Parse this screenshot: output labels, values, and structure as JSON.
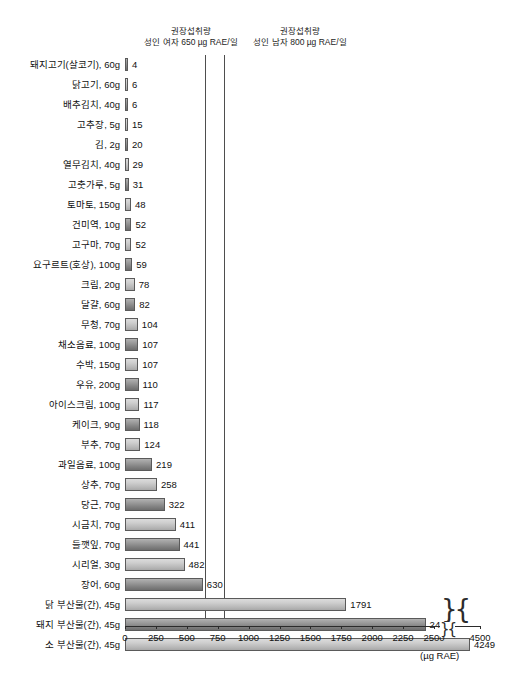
{
  "annotations": {
    "rda_female": {
      "title": "권장섭취량",
      "subtitle": "성인 여자 650 µg RAE/일",
      "value": 650
    },
    "rda_male": {
      "title": "권장섭취량",
      "subtitle": "성인 남자 800 µg RAE/일",
      "value": 800
    }
  },
  "axis": {
    "unit_label": "(µg RAE)",
    "ticks": [
      0,
      250,
      500,
      750,
      1000,
      1250,
      1500,
      1750,
      2000,
      2250,
      2500
    ],
    "break_tick": 4500,
    "break_symbol": "}{"
  },
  "chart_data": {
    "type": "bar",
    "orientation": "horizontal",
    "title": "",
    "xlabel": "(µg RAE)",
    "ylabel": "",
    "xlim": [
      0,
      2750
    ],
    "grid": false,
    "legend": "none",
    "axis_break": {
      "after": 2600,
      "resumes_at": 4400,
      "label": 4500
    },
    "reference_lines": [
      {
        "value": 650,
        "label": "권장섭취량 성인 여자 650 µg RAE/일"
      },
      {
        "value": 800,
        "label": "권장섭취량 성인 남자 800 µg RAE/일"
      }
    ],
    "categories": [
      "돼지고기(살코기), 60g",
      "닭고기, 60g",
      "배추김치, 40g",
      "고추장, 5g",
      "김, 2g",
      "열무김치, 40g",
      "고춧가루, 5g",
      "토마토, 150g",
      "건미역, 10g",
      "고구마, 70g",
      "요구르트(호상), 100g",
      "크림, 20g",
      "달걀, 60g",
      "무청, 70g",
      "채소음료, 100g",
      "수박, 150g",
      "우유, 200g",
      "아이스크림, 100g",
      "케이크, 90g",
      "부추, 70g",
      "과일음료, 100g",
      "상추, 70g",
      "당근, 70g",
      "시금치, 70g",
      "들깻잎, 70g",
      "시리얼, 30g",
      "장어, 60g",
      "닭 부산물(간), 45g",
      "돼지 부산물(간), 45g",
      "소 부산물(간), 45g"
    ],
    "values": [
      4,
      6,
      6,
      15,
      20,
      29,
      31,
      48,
      52,
      52,
      59,
      78,
      82,
      104,
      107,
      107,
      110,
      117,
      118,
      124,
      219,
      258,
      322,
      411,
      441,
      482,
      630,
      1791,
      2432,
      4249
    ],
    "value_labels": [
      "4",
      "6",
      "6",
      "15",
      "20",
      "29",
      "31",
      "48",
      "52",
      "52",
      "59",
      "78",
      "82",
      "104",
      "107",
      "107",
      "110",
      "117",
      "118",
      "124",
      "219",
      "258",
      "322",
      "411",
      "441",
      "482",
      "630",
      "1791",
      "2432",
      "4249"
    ]
  },
  "colors": {
    "bar_dark": "#8a8a8a",
    "bar_light": "#c6c6c6",
    "bar_border": "#5a5a5a",
    "axis": "#2b2b2b",
    "reference_line": "#4e4e4e",
    "text": "#111111",
    "background": "#ffffff"
  }
}
